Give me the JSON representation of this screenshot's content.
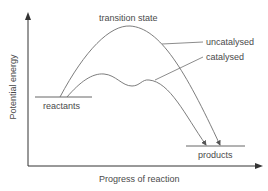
{
  "diagram": {
    "title": "",
    "axes": {
      "x_label": "Progress of reaction",
      "y_label": "Potential energy"
    },
    "labels": {
      "transition_state": "transition state",
      "uncatalysed": "uncatalysed",
      "catalysed": "catalysed",
      "reactants": "reactants",
      "products": "products"
    },
    "colors": {
      "line": "#6e6e6e",
      "text": "#4a4a4a"
    }
  }
}
